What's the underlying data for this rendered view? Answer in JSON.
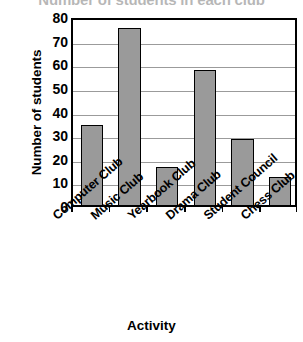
{
  "chart_data": {
    "type": "bar",
    "title": "Number of students in each club",
    "xlabel": "Activity",
    "ylabel": "Number of students",
    "categories": [
      "Computer Club",
      "Music Club",
      "Yearbook Club",
      "Drama Club",
      "Student Council",
      "Chess Club"
    ],
    "values": [
      34,
      75,
      16,
      57,
      28,
      12
    ],
    "ylim": [
      0,
      80
    ],
    "ytick_values": [
      0,
      10,
      20,
      30,
      40,
      50,
      60,
      70,
      80
    ],
    "ytick_labels": [
      "0",
      "10",
      "20",
      "30",
      "40",
      "50",
      "60",
      "70",
      "80"
    ],
    "grid": true,
    "grid_axis": "y",
    "legend": false,
    "bar_color": "#9a9a9a",
    "bar_edge_color": "#000000",
    "grid_color": "#9b9b9b",
    "frame_color": "#000000",
    "background": "#ffffff",
    "xtick_label_rotation": -41,
    "title_clipped": true
  }
}
